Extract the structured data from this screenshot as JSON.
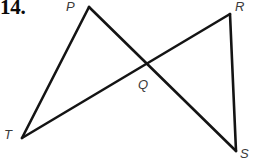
{
  "figure": {
    "problem_number": "14.",
    "width": 256,
    "height": 164,
    "background_color": "#ffffff",
    "stroke_color": "#141414",
    "label_color": "#3a3a3a",
    "labels": {
      "p": "P",
      "r": "R",
      "q": "Q",
      "t": "T",
      "s": "S"
    },
    "points": {
      "P": {
        "x": 89,
        "y": 7
      },
      "R": {
        "x": 230,
        "y": 14
      },
      "Q": {
        "x": 143,
        "y": 70
      },
      "T": {
        "x": 22,
        "y": 138
      },
      "S": {
        "x": 236,
        "y": 151
      }
    },
    "segments": [
      {
        "name": "TP",
        "from": "T",
        "to": "P"
      },
      {
        "name": "PS",
        "from": "P",
        "to": "S"
      },
      {
        "name": "TR",
        "from": "T",
        "to": "R"
      },
      {
        "name": "RS",
        "from": "R",
        "to": "S"
      }
    ]
  }
}
